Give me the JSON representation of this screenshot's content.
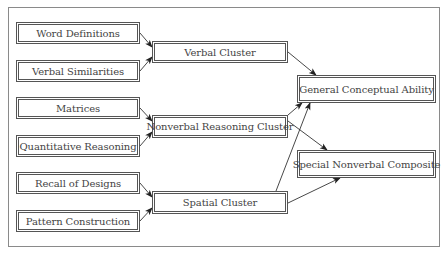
{
  "diagram": {
    "type": "flow-hierarchy",
    "nodes": [
      {
        "id": "word_definitions",
        "label": "Word Definitions",
        "level": "subtest",
        "x": 16,
        "y": 22,
        "w": 124,
        "h": 22
      },
      {
        "id": "verbal_similarities",
        "label": "Verbal Similarities",
        "level": "subtest",
        "x": 16,
        "y": 60,
        "w": 124,
        "h": 22
      },
      {
        "id": "matrices",
        "label": "Matrices",
        "level": "subtest",
        "x": 16,
        "y": 97,
        "w": 124,
        "h": 22
      },
      {
        "id": "quantitative_reasoning",
        "label": "Quantitative Reasoning",
        "level": "subtest",
        "x": 16,
        "y": 135,
        "w": 124,
        "h": 22
      },
      {
        "id": "recall_of_designs",
        "label": "Recall of Designs",
        "level": "subtest",
        "x": 16,
        "y": 172,
        "w": 124,
        "h": 22
      },
      {
        "id": "pattern_construction",
        "label": "Pattern Construction",
        "level": "subtest",
        "x": 16,
        "y": 210,
        "w": 124,
        "h": 22
      },
      {
        "id": "verbal_cluster",
        "label": "Verbal Cluster",
        "level": "cluster",
        "x": 152,
        "y": 41,
        "w": 136,
        "h": 22
      },
      {
        "id": "nonverbal_reasoning_cluster",
        "label": "Nonverbal Reasoning Cluster",
        "level": "cluster",
        "x": 152,
        "y": 115,
        "w": 136,
        "h": 23
      },
      {
        "id": "spatial_cluster",
        "label": "Spatial Cluster",
        "level": "cluster",
        "x": 152,
        "y": 191,
        "w": 136,
        "h": 23
      },
      {
        "id": "general_conceptual_ability",
        "label": "General Conceptual Ability",
        "level": "composite",
        "x": 297,
        "y": 75,
        "w": 139,
        "h": 28
      },
      {
        "id": "special_nonverbal_composite",
        "label": "Special Nonverbal Composite",
        "level": "composite",
        "x": 297,
        "y": 150,
        "w": 139,
        "h": 28
      }
    ],
    "edges": [
      {
        "from": "word_definitions",
        "to": "verbal_cluster",
        "x1": 140,
        "y1": 33,
        "x2": 152,
        "y2": 47
      },
      {
        "from": "verbal_similarities",
        "to": "verbal_cluster",
        "x1": 140,
        "y1": 71,
        "x2": 152,
        "y2": 57
      },
      {
        "from": "matrices",
        "to": "nonverbal_reasoning_cluster",
        "x1": 140,
        "y1": 108,
        "x2": 152,
        "y2": 121
      },
      {
        "from": "quantitative_reasoning",
        "to": "nonverbal_reasoning_cluster",
        "x1": 140,
        "y1": 146,
        "x2": 152,
        "y2": 132
      },
      {
        "from": "recall_of_designs",
        "to": "spatial_cluster",
        "x1": 140,
        "y1": 183,
        "x2": 152,
        "y2": 197
      },
      {
        "from": "pattern_construction",
        "to": "spatial_cluster",
        "x1": 140,
        "y1": 221,
        "x2": 152,
        "y2": 208
      },
      {
        "from": "verbal_cluster",
        "to": "general_conceptual_ability",
        "x1": 288,
        "y1": 52,
        "x2": 316,
        "y2": 75
      },
      {
        "from": "nonverbal_reasoning_cluster",
        "to": "general_conceptual_ability",
        "x1": 288,
        "y1": 115,
        "x2": 302,
        "y2": 103
      },
      {
        "from": "nonverbal_reasoning_cluster",
        "to": "special_nonverbal_composite",
        "x1": 288,
        "y1": 121,
        "x2": 327,
        "y2": 150
      },
      {
        "from": "spatial_cluster",
        "to": "general_conceptual_ability",
        "x1": 276,
        "y1": 191,
        "x2": 310,
        "y2": 103
      },
      {
        "from": "spatial_cluster",
        "to": "special_nonverbal_composite",
        "x1": 288,
        "y1": 203,
        "x2": 340,
        "y2": 178
      }
    ]
  }
}
